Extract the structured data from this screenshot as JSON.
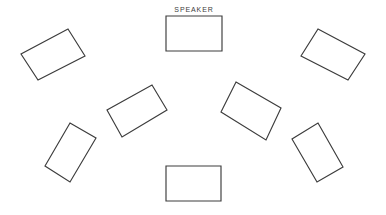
{
  "canvas": {
    "width": 386,
    "height": 215,
    "background_color": "#ffffff",
    "line_color": "#3c3c3c",
    "line_width": 1.15
  },
  "labels": {
    "speaker": "SPEAKER",
    "speaker_x": 194,
    "speaker_y": 12
  },
  "chart_data": {
    "type": "diagram",
    "title": "SPEAKER",
    "units": "pixels",
    "shape_count": 9,
    "shapes": [
      {
        "id": "speaker-table",
        "name": "speaker-table",
        "label": "SPEAKER",
        "orientation": "landscape",
        "rotation_deg": 0,
        "center": [
          194,
          33.5
        ],
        "width": 56,
        "height": 35,
        "points": "166,16 222,16 222,51 166,51"
      },
      {
        "id": "table-top-left",
        "name": "table-top-left",
        "label": "",
        "orientation": "landscape",
        "rotation_deg": -28,
        "center": [
          53,
          54.5
        ],
        "width": 54,
        "height": 33,
        "points": "68,29 85,56 38,80 21,54"
      },
      {
        "id": "table-top-right",
        "name": "table-top-right",
        "label": "",
        "orientation": "landscape",
        "rotation_deg": 28,
        "center": [
          333,
          54.5
        ],
        "width": 54,
        "height": 33,
        "points": "318,29 365,54 348,80 301,56"
      },
      {
        "id": "table-mid-left",
        "name": "table-mid-left",
        "label": "",
        "orientation": "landscape",
        "rotation_deg": -25,
        "center": [
          137,
          110
        ],
        "width": 54,
        "height": 33,
        "points": "152,85 167,110 122,137 107,110"
      },
      {
        "id": "table-mid-right",
        "name": "table-mid-right",
        "label": "",
        "orientation": "landscape",
        "rotation_deg": 25,
        "center": [
          250,
          110
        ],
        "width": 54,
        "height": 33,
        "points": "236,82 281,108 266,140 221,112"
      },
      {
        "id": "table-low-left",
        "name": "table-low-left",
        "label": "",
        "orientation": "portrait",
        "rotation_deg": -22,
        "center": [
          70,
          152
        ],
        "width": 34,
        "height": 54,
        "points": "70,123 96,138 70,182 45,166"
      },
      {
        "id": "table-low-right",
        "name": "table-low-right",
        "label": "",
        "orientation": "portrait",
        "rotation_deg": 22,
        "center": [
          317,
          152
        ],
        "width": 34,
        "height": 54,
        "points": "318,123 343,167 317,182 292,139"
      },
      {
        "id": "table-bottom-center",
        "name": "table-bottom-center",
        "label": "",
        "orientation": "landscape",
        "rotation_deg": 0,
        "center": [
          193.5,
          183.5
        ],
        "width": 55,
        "height": 35,
        "points": "166,166 221,166 221,201 166,201"
      }
    ]
  }
}
